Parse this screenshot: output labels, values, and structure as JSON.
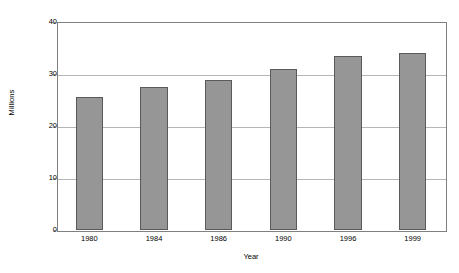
{
  "chart_data": {
    "type": "bar",
    "title": "",
    "subtitle": "",
    "xlabel": "Year",
    "ylabel": "Millions",
    "categories": [
      "1980",
      "1984",
      "1986",
      "1990",
      "1996",
      "1999"
    ],
    "values": [
      25.5,
      27.5,
      28.8,
      31.0,
      33.5,
      34.0
    ],
    "series": [
      {
        "name": "Millions",
        "values": [
          25.5,
          27.5,
          28.8,
          31.0,
          33.5,
          34.0
        ]
      }
    ],
    "ylim": [
      0,
      40
    ],
    "yticks": [
      0,
      10,
      20,
      30,
      40
    ],
    "ytick_labels": [
      "0",
      "10",
      "20",
      "30",
      "40"
    ],
    "grid": true,
    "grid_axis": "y",
    "legend": false,
    "legend_position": "none",
    "bar_color": "#969696",
    "bar_edge_color": "#5a5a5a",
    "gridline_color": "#b5b5b5",
    "axis_color": "#808080",
    "background_color": "#ffffff",
    "annotations": []
  },
  "axes": {
    "y_title": "Millions",
    "x_title": "Year"
  }
}
